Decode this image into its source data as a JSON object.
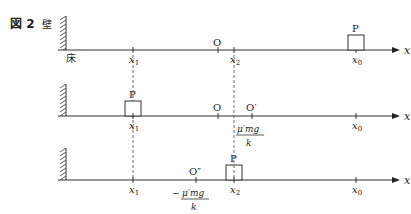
{
  "figure": {
    "label": "図 2",
    "wall_label": "壁",
    "floor_label": "床"
  },
  "rows": [
    {
      "block_label": "P",
      "ticks": {
        "x1": "x",
        "x1_sub": "1",
        "O": "O",
        "x2": "x",
        "x2_sub": "2",
        "x0": "x",
        "x0_sub": "0"
      },
      "axis_label": "x"
    },
    {
      "block_label": "P",
      "ticks": {
        "x1": "x",
        "x1_sub": "1",
        "O": "O",
        "Oprime": "O′",
        "x0": "x",
        "x0_sub": "0"
      },
      "offset_num": "μ′mg",
      "offset_den": "k",
      "axis_label": "x"
    },
    {
      "block_label": "P",
      "ticks": {
        "x1": "x",
        "x1_sub": "1",
        "Odouble": "O″",
        "x2": "x",
        "x2_sub": "2",
        "x0": "x",
        "x0_sub": "0"
      },
      "offset_sign": "−",
      "offset_num": "μ′mg",
      "offset_den": "k",
      "axis_label": "x"
    }
  ],
  "colors": {
    "line": "#333333",
    "text": "#222222"
  }
}
